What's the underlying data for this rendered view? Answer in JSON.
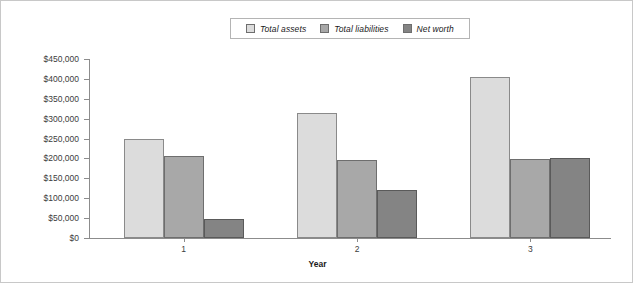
{
  "chart_data": {
    "type": "bar",
    "title": "",
    "subtitle": "",
    "xlabel": "Year",
    "ylabel": "",
    "categories": [
      "1",
      "2",
      "3"
    ],
    "series": [
      {
        "name": "Total assets",
        "color": "#dcdcdc",
        "values": [
          250000,
          315000,
          405000
        ]
      },
      {
        "name": "Total liabilities",
        "color": "#a8a8a8",
        "values": [
          205000,
          197000,
          198000
        ]
      },
      {
        "name": "Net worth",
        "color": "#848484",
        "values": [
          48000,
          120000,
          200000
        ]
      }
    ],
    "ylim": [
      0,
      450000
    ],
    "ytick_values": [
      0,
      50000,
      100000,
      150000,
      200000,
      250000,
      300000,
      350000,
      400000,
      450000
    ],
    "ytick_labels": [
      "$0",
      "$50,000",
      "$100,000",
      "$150,000",
      "$200,000",
      "$250,000",
      "$300,000",
      "$350,000",
      "$400,000",
      "$450,000"
    ],
    "grid": false,
    "legend_position": "top-center",
    "legend_entries": [
      "Total assets",
      "Total liabilities",
      "Net worth"
    ]
  }
}
